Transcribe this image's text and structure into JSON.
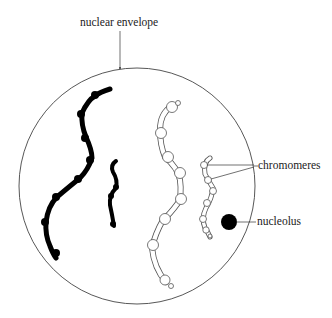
{
  "diagram": {
    "labels": {
      "nuclear_envelope": "nuclear envelope",
      "chromomeres": "chromomeres",
      "nucleolus": "nucleolus"
    },
    "colors": {
      "line": "#333333",
      "chromosome_solid": "#000000",
      "chromosome_outline": "#555555",
      "background": "#ffffff"
    },
    "nucleus": {
      "cx": 137,
      "cy": 186,
      "r": 118
    }
  }
}
